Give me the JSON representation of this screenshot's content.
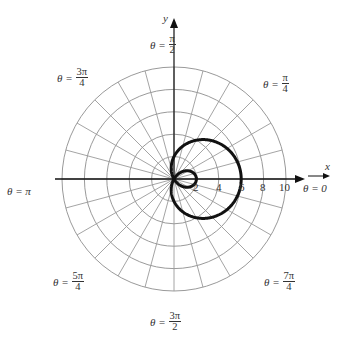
{
  "figure": {
    "curve": {
      "equation": "r = 2 + 4cos(theta)",
      "a": 2,
      "b": 4,
      "color": "#111111",
      "stroke_width": 3
    },
    "grid": {
      "circle_radii": [
        2,
        4,
        6,
        8,
        10
      ],
      "radial_step_degrees": 15,
      "color": "#9a9a9a"
    },
    "axes": {
      "x_label": "x",
      "y_label": "y",
      "x_tick_labels": [
        "2",
        "4",
        "6",
        "8",
        "10"
      ]
    },
    "angle_labels": {
      "zero": {
        "lhs": "θ = 0"
      },
      "pi_4": {
        "lhs": "θ =",
        "num": "π",
        "den": "4"
      },
      "pi_2": {
        "lhs": "θ =",
        "num": "π",
        "den": "2"
      },
      "3pi_4": {
        "lhs": "θ =",
        "num": "3π",
        "den": "4"
      },
      "pi": {
        "lhs": "θ = π"
      },
      "5pi_4": {
        "lhs": "θ =",
        "num": "5π",
        "den": "4"
      },
      "3pi_2": {
        "lhs": "θ =",
        "num": "3π",
        "den": "2"
      },
      "7pi_4": {
        "lhs": "θ =",
        "num": "7π",
        "den": "4"
      }
    }
  }
}
